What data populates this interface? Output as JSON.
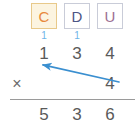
{
  "worksheet": {
    "operation_symbol": "×",
    "place_value_headers": [
      {
        "label": "C",
        "name": "hundreds",
        "text_color": "#e8883c",
        "fill_color": "#fcf4e0",
        "border_color": "#e8c98a",
        "highlighted": true
      },
      {
        "label": "D",
        "name": "tens",
        "text_color": "#4c5585",
        "fill_color": "#ffffff",
        "border_color": "#c9ccd8",
        "highlighted": false
      },
      {
        "label": "U",
        "name": "units",
        "text_color": "#9c6f93",
        "fill_color": "#ffffff",
        "border_color": "#c9ccd8",
        "highlighted": false
      }
    ],
    "carries": {
      "hundreds": "1",
      "tens": "1",
      "color": "#6fb4e8"
    },
    "multiplicand": {
      "hundreds": "1",
      "tens": "3",
      "units": "4"
    },
    "multiplier": {
      "hundreds": "",
      "tens": "",
      "units": "4"
    },
    "product": {
      "hundreds": "5",
      "tens": "3",
      "units": "6"
    },
    "arrow": {
      "name": "carry-arrow",
      "color": "#3a8fd0",
      "from_x": 119,
      "from_y": 82,
      "to_x": 39,
      "to_y": 64
    },
    "digit_color": "#5a5a5a",
    "rule_color": "#9a9a9a"
  }
}
